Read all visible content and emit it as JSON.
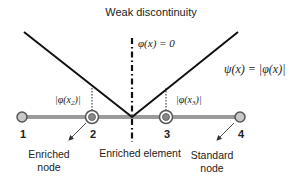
{
  "title": "Weak discontinuity",
  "level_set_label": "φ(x) = 0",
  "enrichment_function_label": "ψ(x) = |φ(x)|",
  "node_value_labels": {
    "node2": "|φ(x",
    "node2_sub": "2",
    "node3": "|φ(x",
    "node3_sub": "3",
    "close": ")|"
  },
  "nodes": [
    {
      "id": "1",
      "type": "standard"
    },
    {
      "id": "2",
      "type": "enriched"
    },
    {
      "id": "3",
      "type": "enriched"
    },
    {
      "id": "4",
      "type": "standard"
    }
  ],
  "annotations": {
    "enriched_node_line1": "Enriched",
    "enriched_node_line2": "node",
    "enriched_element": "Enriched element",
    "standard_node_line1": "Standard",
    "standard_node_line2": "node"
  },
  "colors": {
    "bar": "#9a9a9a",
    "node_fill": "#c8c8c8",
    "node_stroke": "#555555",
    "line": "#111111"
  }
}
